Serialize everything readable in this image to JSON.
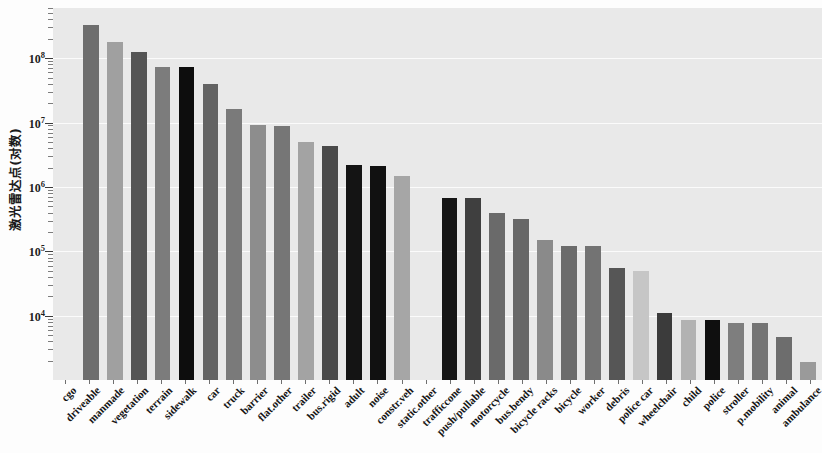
{
  "chart_data": {
    "type": "bar",
    "title": "",
    "xlabel": "",
    "ylabel": "激光雷达点(对数)",
    "yscale": "log",
    "ylim": [
      1000,
      600000000
    ],
    "grid": true,
    "legend": "none",
    "ytick_labels": [
      "10",
      "10",
      "10",
      "10",
      "10"
    ],
    "ytick_exponents": [
      "8",
      "7",
      "6",
      "5",
      "4"
    ],
    "ytick_values": [
      100000000,
      10000000,
      1000000,
      100000,
      10000
    ],
    "categories": [
      "cgo",
      "driveable",
      "manmade",
      "vegetation",
      "terrain",
      "sidewalk",
      "car",
      "truck",
      "barrier",
      "flat.other",
      "trailer",
      "bus.rigid",
      "adult",
      "noise",
      "constr.veh",
      "static.other",
      "trafficcone",
      "push/pullable",
      "motorcycle",
      "bus.bendy",
      "bicycle racks",
      "bicycle",
      "worker",
      "debris",
      "police car",
      "wheelchair",
      "child",
      "police",
      "stroller",
      "p.mobility",
      "animal",
      "ambulance"
    ],
    "values": [
      0,
      330000000,
      180000000,
      125000000,
      72000000,
      72000000,
      40000000,
      16500000,
      9300000,
      8800000,
      4900000,
      4300000,
      2200000,
      2100000,
      1500000,
      0,
      680000,
      670000,
      390000,
      320000,
      150000,
      122000,
      120000,
      55000,
      50000,
      11000,
      8600,
      8600,
      7800,
      7700,
      4600,
      1900
    ],
    "bar_colors": [
      "#9b9b9b",
      "#6e6e6e",
      "#a0a0a0",
      "#555555",
      "#7c7c7c",
      "#0d0d0d",
      "#636363",
      "#7a7a7a",
      "#8d8d8d",
      "#767676",
      "#a3a3a3",
      "#4a4a4a",
      "#141414",
      "#111111",
      "#a6a6a6",
      "#cfcfcf",
      "#161616",
      "#3f3f3f",
      "#6a6a6a",
      "#676767",
      "#8a8a8a",
      "#6b6b6b",
      "#737373",
      "#565656",
      "#c6c6c6",
      "#3b3b3b",
      "#b2b2b2",
      "#0f0f0f",
      "#7e7e7e",
      "#747474",
      "#6d6d6d",
      "#9a9a9a"
    ]
  }
}
